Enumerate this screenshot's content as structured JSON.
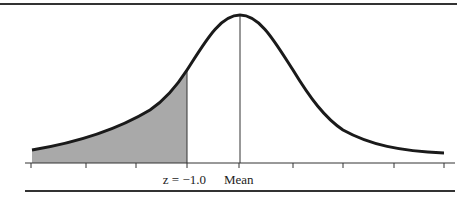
{
  "figure": {
    "type": "normal-distribution-diagram",
    "shaded_region": "left tail below z = -1.0",
    "labels": {
      "z_label": "z = −1.0",
      "mean_label": "Mean"
    },
    "colors": {
      "curve": "#1a1a1a",
      "shade": "#a9a9a9",
      "axis": "#333333"
    }
  }
}
